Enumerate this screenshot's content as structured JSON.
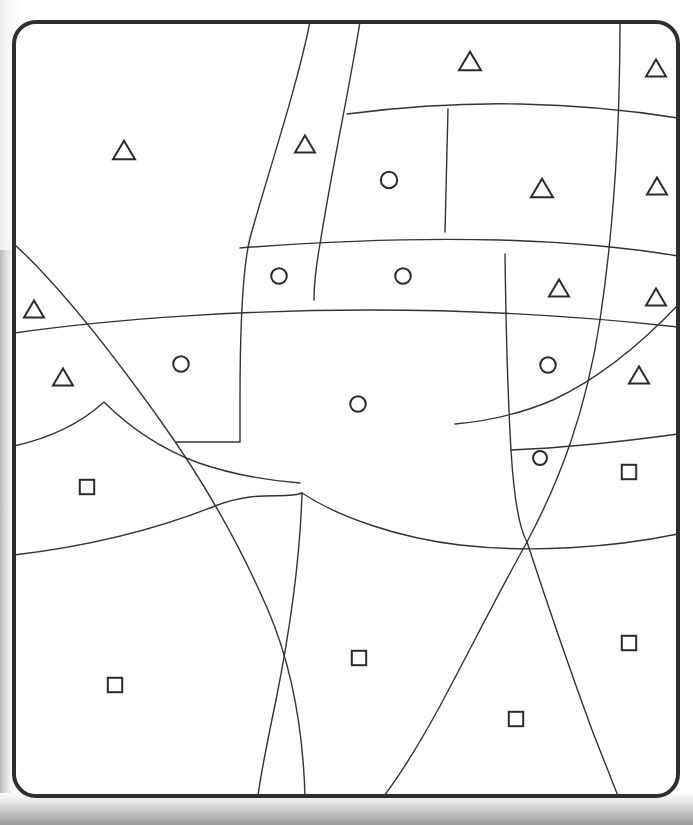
{
  "document": {
    "title": "Partitioned Region Diagram",
    "kind": "line-drawing",
    "description": "Rounded rectangular frame subdivided by smooth curves into irregular regions, each region marked with a single symbol."
  },
  "canvas": {
    "width": 693,
    "height": 825,
    "background_color": "#ffffff",
    "paper_shadow_color": "#9a9a9a"
  },
  "frame": {
    "name": "outer-rounded-frame",
    "x": 14,
    "y": 22,
    "width": 664,
    "height": 774,
    "corner_radius": 22,
    "stroke_color": "#2e2e2e",
    "stroke_width": 4,
    "fill_color": "#ffffff"
  },
  "styles": {
    "partition_stroke_color": "#333333",
    "partition_stroke_width": 1.4,
    "symbol_stroke_color": "#2b2b2b",
    "symbol_stroke_width": 2
  },
  "legend": {
    "symbols": [
      {
        "key": "triangle",
        "glyph": "△",
        "label": "triangle",
        "count": 12
      },
      {
        "key": "circle",
        "glyph": "○",
        "label": "circle",
        "count": 8
      },
      {
        "key": "square",
        "glyph": "□",
        "label": "square",
        "count": 6
      }
    ],
    "total_symbols": 26
  },
  "partitions": [
    {
      "name": "curve-left-long-vertical",
      "d": "M 310 22 C 296 90 272 160 250 238 C 243 266 240 330 240 400 L 240 442 L 176 442"
    },
    {
      "name": "curve-second-vertical",
      "d": "M 360 22 C 348 96 332 168 320 244 C 315 272 314 284 314 300"
    },
    {
      "name": "curve-upper-horizontal",
      "d": "M 347 114 C 410 106 470 103 520 104 C 575 105 628 110 678 118"
    },
    {
      "name": "curve-inner-vertical-a",
      "d": "M 448 109 C 447 150 446 190 445 232"
    },
    {
      "name": "curve-mid-horizontal-top",
      "d": "M 240 248 C 330 241 420 238 500 240 C 570 242 630 248 678 256"
    },
    {
      "name": "curve-mid-horizontal-main",
      "d": "M 14 333 C 120 318 250 310 370 310 C 470 310 580 316 678 327"
    },
    {
      "name": "curve-right-vertical-long",
      "d": "M 620 22 C 620 120 615 220 600 320 C 586 412 560 480 527 542"
    },
    {
      "name": "curve-right-vertical-b",
      "d": "M 505 254 C 506 330 508 400 511 450 C 514 500 519 528 527 542"
    },
    {
      "name": "curve-right-horizontal-a",
      "d": "M 511 450 C 560 448 620 442 678 434"
    },
    {
      "name": "curve-big-right-arc",
      "d": "M 678 305 C 640 345 600 378 553 400 C 520 414 490 421 455 424"
    },
    {
      "name": "curve-diagonal-left",
      "d": "M 14 244 C 60 286 110 350 160 420 C 205 483 240 545 268 610 C 292 666 303 730 305 796"
    },
    {
      "name": "curve-left-hump",
      "d": "M 14 446 C 50 438 80 424 104 402 C 130 428 160 448 196 462 C 230 474 262 480 300 483"
    },
    {
      "name": "curve-lower-horizontal",
      "d": "M 14 555 C 90 546 160 528 215 506 C 258 489 285 500 302 493 C 340 518 400 538 460 545 C 530 553 610 548 678 534"
    },
    {
      "name": "curve-bottom-left-vert",
      "d": "M 302 493 C 300 560 290 630 276 700 C 266 748 260 778 258 796"
    },
    {
      "name": "curve-bottom-diagonal",
      "d": "M 527 542 C 500 590 470 650 440 706 C 415 752 396 780 384 796"
    },
    {
      "name": "curve-bottom-right-vert",
      "d": "M 527 542 C 546 600 570 670 592 730 C 606 766 614 786 618 796"
    }
  ],
  "symbols": [
    {
      "id": 1,
      "type": "triangle",
      "x": 124,
      "y": 150,
      "size": 22,
      "region": "upper-left"
    },
    {
      "id": 2,
      "type": "triangle",
      "x": 305,
      "y": 144,
      "size": 20,
      "region": "upper-band-a"
    },
    {
      "id": 3,
      "type": "triangle",
      "x": 470,
      "y": 61,
      "size": 22,
      "region": "top-center"
    },
    {
      "id": 4,
      "type": "triangle",
      "x": 656,
      "y": 68,
      "size": 20,
      "region": "top-right-corner"
    },
    {
      "id": 5,
      "type": "circle",
      "x": 389,
      "y": 180,
      "size": 20,
      "region": "upper-center-box"
    },
    {
      "id": 6,
      "type": "triangle",
      "x": 542,
      "y": 188,
      "size": 22,
      "region": "upper-right-box"
    },
    {
      "id": 7,
      "type": "triangle",
      "x": 657,
      "y": 186,
      "size": 20,
      "region": "right-edge-upper"
    },
    {
      "id": 8,
      "type": "circle",
      "x": 279,
      "y": 276,
      "size": 19,
      "region": "mid-band-left"
    },
    {
      "id": 9,
      "type": "circle",
      "x": 403,
      "y": 276,
      "size": 19,
      "region": "mid-band-center"
    },
    {
      "id": 10,
      "type": "triangle",
      "x": 559,
      "y": 288,
      "size": 20,
      "region": "mid-band-right"
    },
    {
      "id": 11,
      "type": "triangle",
      "x": 656,
      "y": 297,
      "size": 20,
      "region": "right-edge-mid"
    },
    {
      "id": 12,
      "type": "triangle",
      "x": 34,
      "y": 309,
      "size": 20,
      "region": "left-edge-upper"
    },
    {
      "id": 13,
      "type": "triangle",
      "x": 63,
      "y": 377,
      "size": 20,
      "region": "left-edge-lower"
    },
    {
      "id": 14,
      "type": "circle",
      "x": 181,
      "y": 364,
      "size": 19,
      "region": "left-center"
    },
    {
      "id": 15,
      "type": "circle",
      "x": 548,
      "y": 365,
      "size": 19,
      "region": "right-center"
    },
    {
      "id": 16,
      "type": "triangle",
      "x": 639,
      "y": 375,
      "size": 20,
      "region": "right-edge-low"
    },
    {
      "id": 17,
      "type": "circle",
      "x": 358,
      "y": 404,
      "size": 19,
      "region": "center-large"
    },
    {
      "id": 18,
      "type": "circle",
      "x": 540,
      "y": 458,
      "size": 17,
      "region": "right-narrow-wedge"
    },
    {
      "id": 19,
      "type": "square",
      "x": 629,
      "y": 472,
      "size": 18,
      "region": "right-lower-box"
    },
    {
      "id": 20,
      "type": "square",
      "x": 87,
      "y": 487,
      "size": 18,
      "region": "left-lower-box"
    },
    {
      "id": 21,
      "type": "square",
      "x": 359,
      "y": 658,
      "size": 18,
      "region": "bottom-center"
    },
    {
      "id": 22,
      "type": "square",
      "x": 115,
      "y": 685,
      "size": 18,
      "region": "bottom-left"
    },
    {
      "id": 23,
      "type": "square",
      "x": 629,
      "y": 643,
      "size": 18,
      "region": "bottom-right-upper"
    },
    {
      "id": 24,
      "type": "square",
      "x": 516,
      "y": 719,
      "size": 18,
      "region": "bottom-right-wedge"
    }
  ]
}
